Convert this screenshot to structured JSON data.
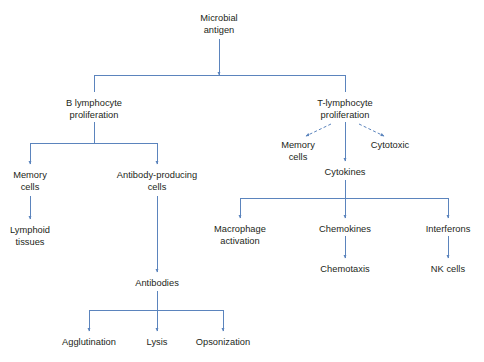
{
  "diagram": {
    "line_color": "#5b84bd",
    "text_color": "#231f20",
    "background": "#ffffff",
    "nodes": [
      {
        "id": "microbial-antigen",
        "lines": [
          "Microbial",
          "antigen"
        ],
        "x": 219,
        "y": 13
      },
      {
        "id": "b-lymphocyte",
        "lines": [
          "B lymphocyte",
          "proliferation"
        ],
        "x": 94,
        "y": 98
      },
      {
        "id": "t-lymphocyte",
        "lines": [
          "T-lymphocyte",
          "proliferation"
        ],
        "x": 345,
        "y": 98
      },
      {
        "id": "b-memory-cells",
        "lines": [
          "Memory",
          "cells"
        ],
        "x": 30,
        "y": 170
      },
      {
        "id": "antibody-producing",
        "lines": [
          "Antibody-producing",
          "cells"
        ],
        "x": 157,
        "y": 170
      },
      {
        "id": "lymphoid-tissues",
        "lines": [
          "Lymphoid",
          "tissues"
        ],
        "x": 30,
        "y": 225
      },
      {
        "id": "t-memory-cells",
        "lines": [
          "Memory",
          "cells"
        ],
        "x": 298,
        "y": 140
      },
      {
        "id": "cytotoxic",
        "lines": [
          "Cytotoxic"
        ],
        "x": 390,
        "y": 140
      },
      {
        "id": "cytokines",
        "lines": [
          "Cytokines"
        ],
        "x": 345,
        "y": 167
      },
      {
        "id": "macrophage-activation",
        "lines": [
          "Macrophage",
          "activation"
        ],
        "x": 240,
        "y": 224
      },
      {
        "id": "chemokines",
        "lines": [
          "Chemokines"
        ],
        "x": 345,
        "y": 224
      },
      {
        "id": "interferons",
        "lines": [
          "Interferons"
        ],
        "x": 448,
        "y": 224
      },
      {
        "id": "chemotaxis",
        "lines": [
          "Chemotaxis"
        ],
        "x": 345,
        "y": 264
      },
      {
        "id": "nk-cells",
        "lines": [
          "NK cells"
        ],
        "x": 448,
        "y": 264
      },
      {
        "id": "antibodies",
        "lines": [
          "Antibodies"
        ],
        "x": 157,
        "y": 278
      },
      {
        "id": "agglutination",
        "lines": [
          "Agglutination"
        ],
        "x": 89,
        "y": 337
      },
      {
        "id": "lysis",
        "lines": [
          "Lysis"
        ],
        "x": 157,
        "y": 337
      },
      {
        "id": "opsonization",
        "lines": [
          "Opsonization"
        ],
        "x": 223,
        "y": 337
      }
    ],
    "edges": [
      {
        "id": "antigen-to-split",
        "kind": "solid",
        "from": "microbial-antigen",
        "to": "split-bar-1",
        "d": "M219,39 L219,75"
      },
      {
        "id": "split-bar-1",
        "kind": "solid",
        "from": "microbial-antigen",
        "to": "lymphocytes",
        "d": "M94,75 L345,75"
      },
      {
        "id": "split-to-b",
        "kind": "solid",
        "from": "split-bar-1",
        "to": "b-lymphocyte",
        "d": "M94,75 L94,92"
      },
      {
        "id": "split-to-t",
        "kind": "solid",
        "from": "split-bar-1",
        "to": "t-lymphocyte",
        "d": "M345,75 L345,92"
      },
      {
        "id": "b-to-bar",
        "kind": "solid",
        "from": "b-lymphocyte",
        "to": "split-bar-2",
        "d": "M94,122 L94,143"
      },
      {
        "id": "split-bar-2",
        "kind": "solid",
        "from": "b-lymphocyte",
        "to": "b-children",
        "d": "M30,143 L157,143"
      },
      {
        "id": "bar2-to-memory",
        "kind": "solid",
        "from": "split-bar-2",
        "to": "b-memory-cells",
        "d": "M30,143 L30,164"
      },
      {
        "id": "bar2-to-antibody-cells",
        "kind": "solid",
        "from": "split-bar-2",
        "to": "antibody-producing",
        "d": "M157,143 L157,164"
      },
      {
        "id": "memory-to-lymphoid",
        "kind": "solid",
        "from": "b-memory-cells",
        "to": "lymphoid-tissues",
        "d": "M30,196 L30,219"
      },
      {
        "id": "antibody-cells-to-antibodies",
        "kind": "solid",
        "from": "antibody-producing",
        "to": "antibodies",
        "d": "M157,196 L157,272"
      },
      {
        "id": "antibodies-to-bar",
        "kind": "solid",
        "from": "antibodies",
        "to": "split-bar-3",
        "d": "M157,291 L157,310"
      },
      {
        "id": "split-bar-3",
        "kind": "solid",
        "from": "antibodies",
        "to": "antibody-functions",
        "d": "M89,310 L223,310"
      },
      {
        "id": "bar3-to-agglutination",
        "kind": "solid",
        "from": "split-bar-3",
        "to": "agglutination",
        "d": "M89,310 L89,331"
      },
      {
        "id": "bar3-to-lysis",
        "kind": "solid",
        "from": "split-bar-3",
        "to": "lysis",
        "d": "M157,310 L157,331"
      },
      {
        "id": "bar3-to-opsonization",
        "kind": "solid",
        "from": "split-bar-3",
        "to": "opsonization",
        "d": "M223,310 L223,331"
      },
      {
        "id": "t-to-memory",
        "kind": "dashed",
        "from": "t-lymphocyte",
        "to": "t-memory-cells",
        "d": "M331,124 L306,136"
      },
      {
        "id": "t-to-cytotoxic",
        "kind": "dashed",
        "from": "t-lymphocyte",
        "to": "cytotoxic",
        "d": "M359,124 L384,136"
      },
      {
        "id": "t-to-cytokines",
        "kind": "solid",
        "from": "t-lymphocyte",
        "to": "cytokines",
        "d": "M345,122 L345,161"
      },
      {
        "id": "cytokines-to-bar",
        "kind": "solid",
        "from": "cytokines",
        "to": "split-bar-4",
        "d": "M345,180 L345,198"
      },
      {
        "id": "split-bar-4",
        "kind": "solid",
        "from": "cytokines",
        "to": "cytokine-children",
        "d": "M240,198 L448,198"
      },
      {
        "id": "bar4-to-macrophage",
        "kind": "solid",
        "from": "split-bar-4",
        "to": "macrophage-activation",
        "d": "M240,198 L240,218"
      },
      {
        "id": "bar4-to-chemokines",
        "kind": "solid",
        "from": "split-bar-4",
        "to": "chemokines",
        "d": "M345,198 L345,218"
      },
      {
        "id": "bar4-to-interferons",
        "kind": "solid",
        "from": "split-bar-4",
        "to": "interferons",
        "d": "M448,198 L448,218"
      },
      {
        "id": "chemokines-to-chemotaxis",
        "kind": "solid",
        "from": "chemokines",
        "to": "chemotaxis",
        "d": "M345,236 L345,258"
      },
      {
        "id": "interferons-to-nk",
        "kind": "solid",
        "from": "interferons",
        "to": "nk-cells",
        "d": "M448,236 L448,258"
      }
    ]
  }
}
